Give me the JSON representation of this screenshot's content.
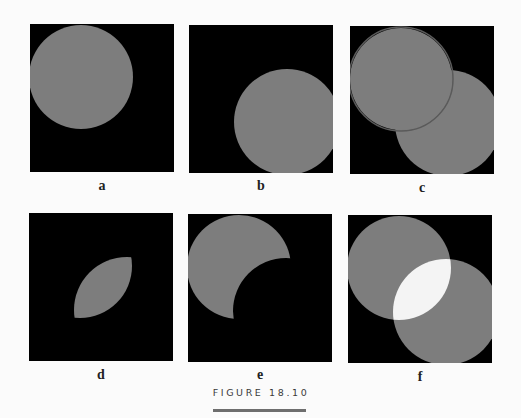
{
  "figure": {
    "caption": "FIGURE 18.10",
    "colors": {
      "background": "#000000",
      "shape": "#7d7d7d",
      "overlap_bright": "#f4f4f4",
      "page": "#fbfbfb"
    },
    "circles": {
      "A": {
        "cx": 51,
        "cy": 53,
        "r": 52
      },
      "B": {
        "cx": 98,
        "cy": 97,
        "r": 53
      }
    },
    "panels": [
      {
        "id": "a",
        "label": "a",
        "content": "circle A"
      },
      {
        "id": "b",
        "label": "b",
        "content": "circle B"
      },
      {
        "id": "c",
        "label": "c",
        "content": "circle A over circle B"
      },
      {
        "id": "d",
        "label": "d",
        "content": "intersection of A and B"
      },
      {
        "id": "e",
        "label": "e",
        "content": "A minus B"
      },
      {
        "id": "f",
        "label": "f",
        "content": "A plus B (overlap brighter)"
      }
    ]
  }
}
